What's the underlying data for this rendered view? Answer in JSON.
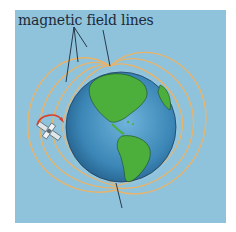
{
  "diagram": {
    "label": "magnetic field lines",
    "elements": {
      "earth": "globe showing the Americas",
      "satellite": "satellite with rotation arrow",
      "field_lines": "dipole magnetic field lines"
    },
    "colors": {
      "background": "#8fc3dc",
      "ocean": "#3b86b6",
      "land": "#4caf3c",
      "field_line": "#e9b36a",
      "arrow": "#d8412c",
      "text": "#1b2a3a"
    }
  }
}
